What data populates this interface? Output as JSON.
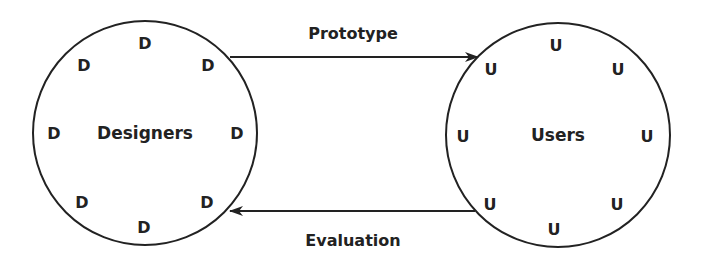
{
  "diagram": {
    "left_group": {
      "label": "Designers",
      "member": "D",
      "members": [
        "D",
        "D",
        "D",
        "D",
        "D",
        "D",
        "D",
        "D"
      ]
    },
    "right_group": {
      "label": "Users",
      "member": "U",
      "members": [
        "U",
        "U",
        "U",
        "U",
        "U",
        "U",
        "U",
        "U"
      ]
    },
    "arrows": [
      {
        "label": "Prototype",
        "from": "Designers",
        "to": "Users"
      },
      {
        "label": "Evaluation",
        "from": "Users",
        "to": "Designers"
      }
    ]
  }
}
